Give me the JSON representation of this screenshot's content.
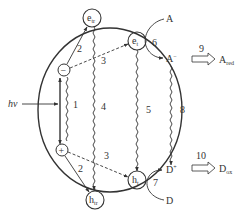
{
  "diagram": {
    "type": "photocatalysis-mechanism",
    "colors": {
      "line": "#333333",
      "background": "#ffffff"
    },
    "light": {
      "label": "hν"
    },
    "charges": {
      "electron": {
        "symbol": "−"
      },
      "hole": {
        "symbol": "+"
      }
    },
    "states": {
      "e_tr": {
        "main": "e",
        "sub": "tr"
      },
      "h_tr": {
        "main": "h",
        "sub": "tr"
      },
      "e_t": {
        "main": "e",
        "sub": "t",
        "sup": "−"
      },
      "h_t": {
        "main": "h",
        "sub": "t",
        "sup": "+"
      }
    },
    "species": {
      "A": "A",
      "A_minus": {
        "main": "A",
        "sup": "−"
      },
      "A_red": {
        "main": "A",
        "sub": "red"
      },
      "D": "D",
      "D_plus": {
        "main": "D",
        "sup": "+"
      },
      "D_ox": {
        "main": "D",
        "sub": "ox"
      }
    },
    "steps": {
      "s1": "1",
      "s2a": "2",
      "s2b": "2",
      "s3a": "3",
      "s3b": "3",
      "s4": "4",
      "s5": "5",
      "s6": "6",
      "s7": "7",
      "s8": "8",
      "s9": "9",
      "s10": "10"
    }
  }
}
